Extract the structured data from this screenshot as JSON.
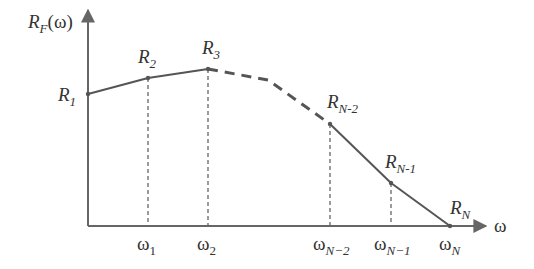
{
  "diagram": {
    "y_axis": {
      "label_main": "R",
      "label_sub": "F",
      "label_tail": "(ω)"
    },
    "x_axis": {
      "label": "ω"
    },
    "points": [
      {
        "id": "R1",
        "main": "R",
        "sub": "1",
        "omega_main": "",
        "omega_sub": "",
        "guide": false
      },
      {
        "id": "R2",
        "main": "R",
        "sub": "2",
        "omega_main": "ω",
        "omega_sub": "1",
        "guide": true
      },
      {
        "id": "R3",
        "main": "R",
        "sub": "3",
        "omega_main": "ω",
        "omega_sub": "2",
        "guide": true
      },
      {
        "id": "RN-2",
        "main": "R",
        "sub": "N-2",
        "omega_main": "ω",
        "omega_sub": "N−2",
        "guide": true
      },
      {
        "id": "RN-1",
        "main": "R",
        "sub": "N-1",
        "omega_main": "ω",
        "omega_sub": "N−1",
        "guide": true
      },
      {
        "id": "RN",
        "main": "R",
        "sub": "N",
        "omega_main": "ω",
        "omega_sub": "N",
        "guide": false
      }
    ],
    "segments": [
      {
        "from": "R1",
        "to": "R2",
        "style": "solid"
      },
      {
        "from": "R2",
        "to": "R3",
        "style": "solid"
      },
      {
        "from": "R3",
        "to": "RN-2",
        "style": "dashed",
        "note": "omitted intermediate segments"
      },
      {
        "from": "RN-2",
        "to": "RN-1",
        "style": "solid"
      },
      {
        "from": "RN-1",
        "to": "RN",
        "style": "solid"
      }
    ],
    "colors": {
      "line": "#555555",
      "text": "#333333"
    }
  }
}
